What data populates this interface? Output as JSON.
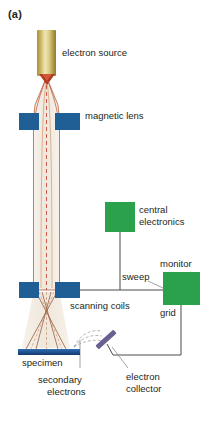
{
  "figure": {
    "panel_label": "(a)",
    "background": "#ffffff"
  },
  "labels": {
    "electron_source": "electron source",
    "magnetic_lens": "magnetic lens",
    "central_electronics_line1": "central",
    "central_electronics_line2": "electronics",
    "monitor": "monitor",
    "sweep": "sweep",
    "grid": "grid",
    "scanning_coils": "scanning coils",
    "specimen": "specimen",
    "secondary_electrons_line1": "secondary",
    "secondary_electrons_line2": "electrons",
    "electron_collector_line1": "electron",
    "electron_collector_line2": "collector"
  },
  "colors": {
    "source_gold": "#c9b35c",
    "lens_blue": "#1f5f96",
    "coil_blue": "#1f5f96",
    "specimen_blue": "#1f4f8f",
    "electronics_green": "#2aa14a",
    "monitor_green": "#2aa14a",
    "collector_purple": "#6b5f8f",
    "beam_outline": "#b5562c",
    "beam_fill": "#f3ece2",
    "wire_gray": "#4a4a4a",
    "text": "#231f20"
  },
  "components": [
    {
      "name": "electron-source",
      "label": "electron source"
    },
    {
      "name": "magnetic-lens",
      "label": "magnetic lens"
    },
    {
      "name": "central-electronics",
      "label": "central electronics"
    },
    {
      "name": "monitor",
      "label": "monitor"
    },
    {
      "name": "scanning-coils",
      "label": "scanning coils"
    },
    {
      "name": "specimen",
      "label": "specimen"
    },
    {
      "name": "electron-collector",
      "label": "electron collector"
    },
    {
      "name": "secondary-electrons",
      "label": "secondary electrons"
    },
    {
      "name": "sweep-signal",
      "label": "sweep"
    },
    {
      "name": "grid-signal",
      "label": "grid"
    }
  ]
}
